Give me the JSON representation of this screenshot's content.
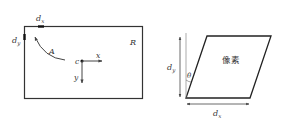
{
  "left_figure": {
    "region_label": "R",
    "curve_label": "A",
    "point_label": "c",
    "x_axis_label": "x",
    "y_axis_label": "y",
    "dx_label": "d",
    "dx_sub": "x",
    "dy_label": "d",
    "dy_sub": "y"
  },
  "right_figure": {
    "pixel_label": "像素",
    "angle_label": "θ",
    "dx_label": "d",
    "dx_sub": "x",
    "dy_label": "d",
    "dy_sub": "y"
  },
  "colors": {
    "stroke": "#333333",
    "arrow_light": "#666666"
  }
}
